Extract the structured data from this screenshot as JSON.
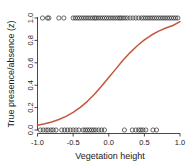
{
  "chart_data": {
    "type": "scatter",
    "title": "",
    "xlabel": "Vegetation height",
    "ylabel": "True presence/absence (z)",
    "xlim": [
      -1.0,
      1.0
    ],
    "ylim": [
      0.0,
      1.0
    ],
    "grid": false,
    "legend": null,
    "xticks": [
      "-1.0",
      "-0.5",
      "0.0",
      "0.5",
      "1.0"
    ],
    "xtick_values": [
      -1.0,
      -0.5,
      0.0,
      0.5,
      1.0
    ],
    "yticks": [
      "0.0",
      "0.2",
      "0.4",
      "0.6",
      "0.8",
      "1.0"
    ],
    "ytick_values": [
      0.0,
      0.2,
      0.4,
      0.6,
      0.8,
      1.0
    ],
    "series": [
      {
        "name": "Observed presence/absence",
        "type": "scatter",
        "marker": "open-circle",
        "color": "#2b2b2b",
        "points": [
          [
            -0.93,
            1
          ],
          [
            -0.86,
            1
          ],
          [
            -0.84,
            1
          ],
          [
            -0.7,
            1
          ],
          [
            -0.63,
            1
          ],
          [
            -0.5,
            1
          ],
          [
            -0.47,
            1
          ],
          [
            -0.44,
            1
          ],
          [
            -0.41,
            1
          ],
          [
            -0.38,
            1
          ],
          [
            -0.35,
            1
          ],
          [
            -0.32,
            1
          ],
          [
            -0.29,
            1
          ],
          [
            -0.26,
            1
          ],
          [
            -0.23,
            1
          ],
          [
            -0.2,
            1
          ],
          [
            -0.18,
            1
          ],
          [
            -0.15,
            1
          ],
          [
            -0.12,
            1
          ],
          [
            -0.09,
            1
          ],
          [
            -0.06,
            1
          ],
          [
            -0.03,
            1
          ],
          [
            0.0,
            1
          ],
          [
            0.03,
            1
          ],
          [
            0.06,
            1
          ],
          [
            0.09,
            1
          ],
          [
            0.12,
            1
          ],
          [
            0.15,
            1
          ],
          [
            0.17,
            1
          ],
          [
            0.2,
            1
          ],
          [
            0.23,
            1
          ],
          [
            0.26,
            1
          ],
          [
            0.3,
            1
          ],
          [
            0.34,
            1
          ],
          [
            0.38,
            1
          ],
          [
            0.42,
            1
          ],
          [
            0.46,
            1
          ],
          [
            0.49,
            1
          ],
          [
            0.52,
            1
          ],
          [
            0.55,
            1
          ],
          [
            0.58,
            1
          ],
          [
            0.61,
            1
          ],
          [
            0.64,
            1
          ],
          [
            0.67,
            1
          ],
          [
            0.7,
            1
          ],
          [
            0.73,
            1
          ],
          [
            0.76,
            1
          ],
          [
            0.79,
            1
          ],
          [
            0.82,
            1
          ],
          [
            0.85,
            1
          ],
          [
            0.88,
            1
          ],
          [
            0.91,
            1
          ],
          [
            0.94,
            1
          ],
          [
            0.97,
            1
          ],
          [
            -0.96,
            0
          ],
          [
            -0.92,
            0
          ],
          [
            -0.88,
            0
          ],
          [
            -0.85,
            0
          ],
          [
            -0.81,
            0
          ],
          [
            -0.78,
            0
          ],
          [
            -0.74,
            0
          ],
          [
            -0.66,
            0
          ],
          [
            -0.62,
            0
          ],
          [
            -0.58,
            0
          ],
          [
            -0.54,
            0
          ],
          [
            -0.5,
            0
          ],
          [
            -0.46,
            0
          ],
          [
            -0.42,
            0
          ],
          [
            -0.36,
            0
          ],
          [
            -0.33,
            0
          ],
          [
            -0.3,
            0
          ],
          [
            -0.27,
            0
          ],
          [
            -0.24,
            0
          ],
          [
            -0.21,
            0
          ],
          [
            -0.18,
            0
          ],
          [
            -0.14,
            0
          ],
          [
            -0.1,
            0
          ],
          [
            -0.06,
            0
          ],
          [
            0.22,
            0
          ],
          [
            0.33,
            0
          ],
          [
            0.38,
            0
          ],
          [
            0.42,
            0
          ],
          [
            0.45,
            0
          ],
          [
            0.48,
            0
          ],
          [
            0.52,
            0
          ],
          [
            0.62,
            0
          ],
          [
            0.67,
            0
          ]
        ]
      },
      {
        "name": "Fitted logistic curve",
        "type": "line",
        "color": "#c4573c",
        "x": [
          -1.0,
          -0.9,
          -0.8,
          -0.7,
          -0.6,
          -0.5,
          -0.4,
          -0.3,
          -0.2,
          -0.1,
          0.0,
          0.1,
          0.2,
          0.3,
          0.4,
          0.5,
          0.6,
          0.7,
          0.8,
          0.9,
          1.0
        ],
        "y": [
          0.042,
          0.055,
          0.072,
          0.094,
          0.122,
          0.158,
          0.202,
          0.256,
          0.32,
          0.392,
          0.468,
          0.546,
          0.622,
          0.691,
          0.752,
          0.805,
          0.848,
          0.883,
          0.911,
          0.933,
          0.968
        ]
      }
    ]
  }
}
